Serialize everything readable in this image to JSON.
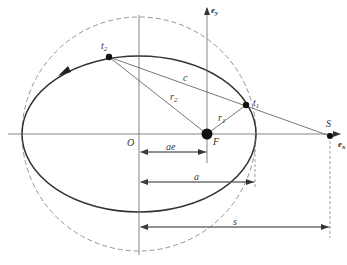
{
  "diagram": {
    "type": "orbital-ellipse-geometry",
    "colors": {
      "line": "#444444",
      "thin": "#666666",
      "dashed": "#888888",
      "background": "#ffffff"
    },
    "labels": {
      "origin": "O",
      "focus": "F",
      "station": "S",
      "t1": "t",
      "t1_sub": "1",
      "t2": "t",
      "t2_sub": "2",
      "r1": "r",
      "r1_sub": "1",
      "r2": "r",
      "r2_sub": "2",
      "chord": "c",
      "ae": "ae",
      "a": "a",
      "s": "s",
      "ex": "e",
      "ex_sub": "x",
      "ey": "e",
      "ey_sub": "y"
    },
    "elements": [
      "ellipse orbit (solid)",
      "auxiliary circle (dashed)",
      "x-axis e_x",
      "y-axis e_y through F",
      "vertical line through O",
      "radius r1 F→t1",
      "radius r2 F→t2",
      "chord c t2→t1 extended to S",
      "dimension ae",
      "dimension a",
      "dimension s",
      "direction arrow on orbit"
    ]
  }
}
